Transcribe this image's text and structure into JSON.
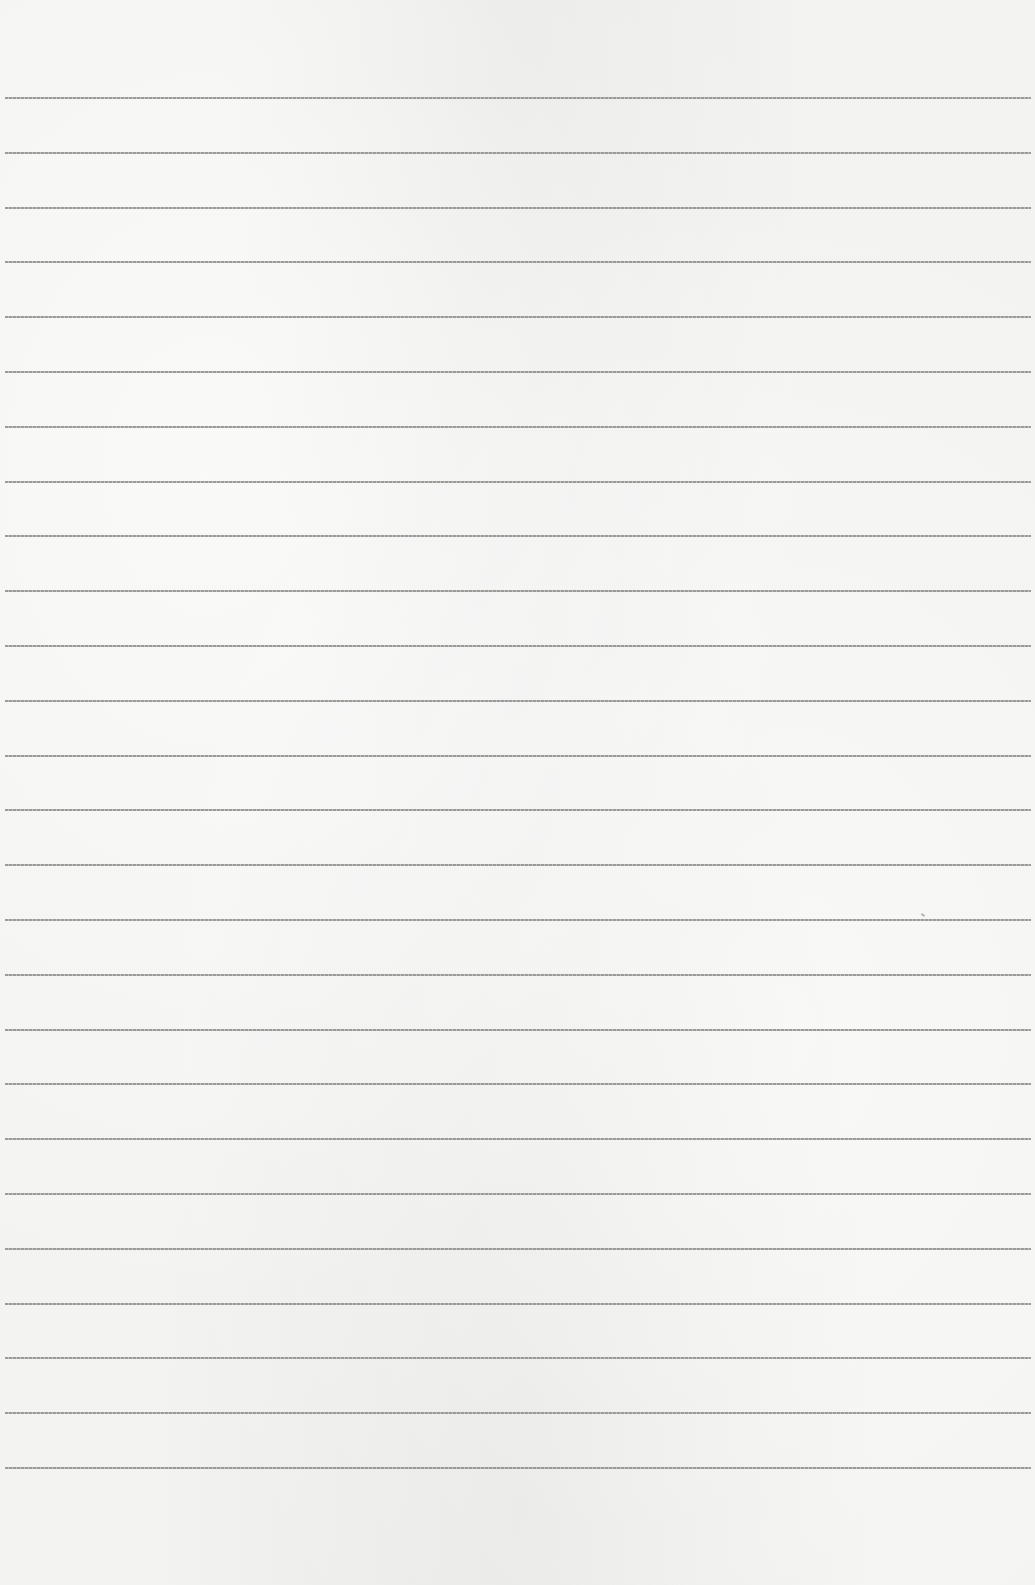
{
  "page": {
    "type": "lined-paper",
    "background_color": "#f3f3f1",
    "line_color": "#8a8a88",
    "line_count": 26,
    "first_line_y": 97,
    "line_spacing": 54.8,
    "text": ""
  }
}
